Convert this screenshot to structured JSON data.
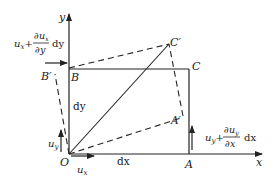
{
  "diagram": {
    "title": "",
    "axes": {
      "x_label": "x",
      "y_label": "y",
      "origin": "O"
    },
    "points": {
      "O": "O",
      "A": "A",
      "B": "B",
      "C": "C",
      "A_prime": "A′",
      "B_prime": "B′",
      "C_prime": "C′"
    },
    "edge_labels": {
      "dx": "dx",
      "dy": "dy"
    },
    "displacements": {
      "ux": "u",
      "ux_sub": "x",
      "uy": "u",
      "uy_sub": "y",
      "top_left": {
        "base": "u",
        "base_sub": "x",
        "plus": "+",
        "num": "∂u",
        "num_sub": "x",
        "den": "∂y",
        "tail": "dy"
      },
      "bottom_right": {
        "base": "u",
        "base_sub": "y",
        "plus": "+",
        "num": "∂u",
        "num_sub": "y",
        "den": "∂x",
        "tail": "dx"
      }
    },
    "colors": {
      "stroke": "#222222",
      "background": "#ffffff"
    }
  }
}
